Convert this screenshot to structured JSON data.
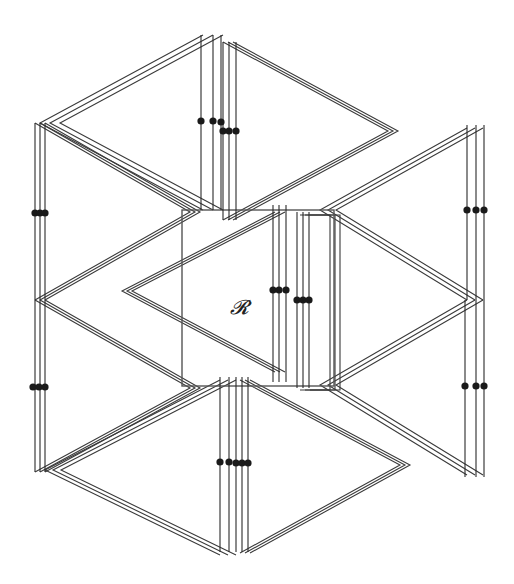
{
  "diagram": {
    "label": "𝓡",
    "colors": {
      "line": "#3a3a3a",
      "dot": "#1a1a1a",
      "background": "#ffffff"
    },
    "central_region": {
      "x": 182,
      "y": 210,
      "w": 152,
      "h": 176
    },
    "shapes": [
      {
        "id": "top-left-wedge",
        "pts": [
          [
            203,
            35
          ],
          [
            40,
            123
          ],
          [
            203,
            210
          ]
        ],
        "offsets": [
          [
            0,
            0
          ],
          [
            10,
            0
          ],
          [
            20,
            0
          ]
        ]
      },
      {
        "id": "top-right-wedge",
        "pts": [
          [
            223,
            42
          ],
          [
            388,
            131
          ],
          [
            223,
            220
          ]
        ],
        "offsets": [
          [
            0,
            0
          ],
          [
            5,
            0
          ],
          [
            10,
            0
          ]
        ]
      },
      {
        "id": "left-upper-wedge",
        "pts": [
          [
            35,
            123
          ],
          [
            190,
            212
          ],
          [
            35,
            300
          ]
        ],
        "offsets": [
          [
            0,
            0
          ],
          [
            5,
            0
          ],
          [
            10,
            0
          ]
        ]
      },
      {
        "id": "left-lower-wedge",
        "pts": [
          [
            35,
            300
          ],
          [
            190,
            388
          ],
          [
            35,
            472
          ]
        ],
        "offsets": [
          [
            0,
            0
          ],
          [
            5,
            0
          ],
          [
            10,
            0
          ]
        ]
      },
      {
        "id": "center-wedge",
        "pts": [
          [
            275,
            212
          ],
          [
            122,
            291
          ],
          [
            275,
            372
          ]
        ],
        "offsets": [
          [
            0,
            0
          ],
          [
            5,
            0
          ],
          [
            10,
            0
          ]
        ]
      },
      {
        "id": "center-right-wedge",
        "pts": [
          [
            300,
            215
          ],
          [
            330,
            215
          ],
          [
            330,
            390
          ],
          [
            300,
            390
          ]
        ],
        "offsets": [
          [
            0,
            0
          ],
          [
            5,
            0
          ],
          [
            10,
            0
          ]
        ]
      },
      {
        "id": "right-upper-wedge",
        "pts": [
          [
            467,
            128
          ],
          [
            320,
            210
          ],
          [
            467,
            300
          ]
        ],
        "offsets": [
          [
            0,
            0
          ],
          [
            8,
            0
          ],
          [
            16,
            0
          ]
        ]
      },
      {
        "id": "right-lower-wedge",
        "pts": [
          [
            467,
            300
          ],
          [
            320,
            385
          ],
          [
            467,
            475
          ]
        ],
        "offsets": [
          [
            0,
            0
          ],
          [
            8,
            0
          ],
          [
            16,
            0
          ]
        ]
      },
      {
        "id": "bottom-left-wedge",
        "pts": [
          [
            220,
            380
          ],
          [
            45,
            470
          ],
          [
            220,
            555
          ]
        ],
        "offsets": [
          [
            0,
            0
          ],
          [
            8,
            0
          ],
          [
            16,
            0
          ]
        ]
      },
      {
        "id": "bottom-right-wedge",
        "pts": [
          [
            240,
            380
          ],
          [
            400,
            465
          ],
          [
            240,
            553
          ]
        ],
        "offsets": [
          [
            0,
            0
          ],
          [
            5,
            0
          ],
          [
            10,
            0
          ]
        ]
      }
    ],
    "vlines": [
      {
        "x": 201,
        "y1": 35,
        "y2": 210
      },
      {
        "x": 213,
        "y1": 35,
        "y2": 210
      },
      {
        "x": 221,
        "y1": 35,
        "y2": 210
      },
      {
        "x": 223,
        "y1": 42,
        "y2": 220
      },
      {
        "x": 229,
        "y1": 42,
        "y2": 220
      },
      {
        "x": 236,
        "y1": 42,
        "y2": 220
      },
      {
        "x": 35,
        "y1": 123,
        "y2": 300
      },
      {
        "x": 40,
        "y1": 123,
        "y2": 300
      },
      {
        "x": 45,
        "y1": 123,
        "y2": 300
      },
      {
        "x": 35,
        "y1": 300,
        "y2": 472
      },
      {
        "x": 40,
        "y1": 300,
        "y2": 472
      },
      {
        "x": 45,
        "y1": 300,
        "y2": 472
      },
      {
        "x": 273,
        "y1": 205,
        "y2": 382
      },
      {
        "x": 279,
        "y1": 205,
        "y2": 382
      },
      {
        "x": 286,
        "y1": 205,
        "y2": 382
      },
      {
        "x": 297,
        "y1": 212,
        "y2": 388
      },
      {
        "x": 303,
        "y1": 212,
        "y2": 388
      },
      {
        "x": 309,
        "y1": 212,
        "y2": 388
      },
      {
        "x": 467,
        "y1": 125,
        "y2": 300
      },
      {
        "x": 476,
        "y1": 125,
        "y2": 300
      },
      {
        "x": 484,
        "y1": 125,
        "y2": 300
      },
      {
        "x": 465,
        "y1": 300,
        "y2": 477
      },
      {
        "x": 476,
        "y1": 300,
        "y2": 477
      },
      {
        "x": 484,
        "y1": 300,
        "y2": 477
      },
      {
        "x": 220,
        "y1": 377,
        "y2": 552
      },
      {
        "x": 229,
        "y1": 377,
        "y2": 552
      },
      {
        "x": 236,
        "y1": 377,
        "y2": 552
      },
      {
        "x": 242,
        "y1": 377,
        "y2": 552
      },
      {
        "x": 248,
        "y1": 377,
        "y2": 552
      }
    ],
    "dots": [
      {
        "x": 201,
        "y": 121
      },
      {
        "x": 213,
        "y": 121
      },
      {
        "x": 221,
        "y": 122
      },
      {
        "x": 223,
        "y": 131
      },
      {
        "x": 229,
        "y": 131
      },
      {
        "x": 236,
        "y": 131
      },
      {
        "x": 35,
        "y": 213
      },
      {
        "x": 40,
        "y": 213
      },
      {
        "x": 45,
        "y": 213
      },
      {
        "x": 33,
        "y": 387
      },
      {
        "x": 39,
        "y": 387
      },
      {
        "x": 45,
        "y": 387
      },
      {
        "x": 273,
        "y": 290
      },
      {
        "x": 279,
        "y": 290
      },
      {
        "x": 286,
        "y": 290
      },
      {
        "x": 297,
        "y": 300
      },
      {
        "x": 303,
        "y": 300
      },
      {
        "x": 309,
        "y": 300
      },
      {
        "x": 467,
        "y": 210
      },
      {
        "x": 476,
        "y": 210
      },
      {
        "x": 484,
        "y": 210
      },
      {
        "x": 465,
        "y": 386
      },
      {
        "x": 476,
        "y": 386
      },
      {
        "x": 484,
        "y": 386
      },
      {
        "x": 220,
        "y": 462
      },
      {
        "x": 229,
        "y": 462
      },
      {
        "x": 236,
        "y": 463
      },
      {
        "x": 242,
        "y": 463
      },
      {
        "x": 248,
        "y": 463
      }
    ]
  }
}
